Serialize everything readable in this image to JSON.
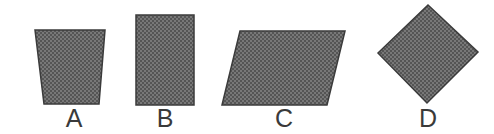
{
  "figure": {
    "width": 494,
    "height": 134,
    "background_color": "#ffffff"
  },
  "style": {
    "fill_color": "#6e6e6e",
    "fill_pattern": "dithered-halftone-gray",
    "fill_dot_color": "#4a4a4a",
    "outline_color": "#3b3b3b",
    "outline_width": 1.5,
    "label_color": "#3a3a3a",
    "label_font_size": 25
  },
  "shapes": [
    {
      "id": "shape-a",
      "label": "A",
      "type": "trapezoid",
      "description": "Trapezoid wider at the top than the bottom",
      "points": "35,30 105,30 99,104 44,104",
      "label_x": 54,
      "label_y": 106
    },
    {
      "id": "shape-b",
      "label": "B",
      "type": "rectangle",
      "description": "Upright rectangle taller than it is wide",
      "points": "136,15 194,15 194,105 136,105",
      "label_x": 145,
      "label_y": 106
    },
    {
      "id": "shape-c",
      "label": "C",
      "type": "parallelogram",
      "description": "Parallelogram slanting to the right",
      "points": "240,31 345,31 327,105 222,105",
      "label_x": 264,
      "label_y": 106
    },
    {
      "id": "shape-d",
      "label": "D",
      "type": "square-rotated",
      "description": "Square rotated approximately 45 degrees forming a diamond",
      "points": "428,5 478,52 427,103 378,53",
      "label_x": 408,
      "label_y": 106
    }
  ]
}
